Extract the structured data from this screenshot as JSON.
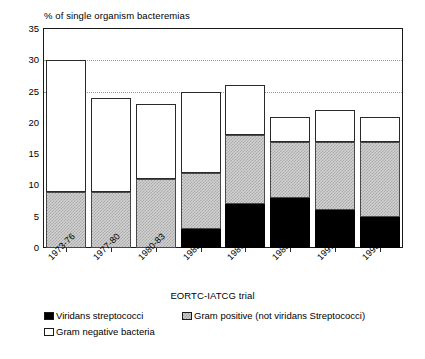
{
  "chart_data": {
    "type": "bar",
    "stacked": true,
    "title": "",
    "ylabel": "% of single organism bacteremias",
    "xlabel": "EORTC-IATCG trial",
    "ylim": [
      0,
      35
    ],
    "yticks": [
      0,
      5,
      10,
      15,
      20,
      25,
      30,
      35
    ],
    "gridlines": [
      25,
      30
    ],
    "grid": true,
    "legend_position": "below",
    "categories": [
      "1973-76",
      "1977-80",
      "1980-83",
      "1983-85",
      "1986-88",
      "1988-91",
      "1991-92",
      "1993-94"
    ],
    "series": [
      {
        "name": "Viridans streptococci",
        "color": "#000000",
        "pattern": "solid-black",
        "values": [
          0,
          0,
          0,
          3,
          7,
          8,
          6,
          5
        ]
      },
      {
        "name": "Gram positive (not viridans Streptococci)",
        "color": "#c8c8c8",
        "pattern": "dotted-gray",
        "values": [
          9,
          9,
          11,
          9,
          11,
          9,
          11,
          12
        ]
      },
      {
        "name": "Gram negative bacteria",
        "color": "#ffffff",
        "pattern": "white",
        "values": [
          21,
          15,
          12,
          13,
          8,
          4,
          5,
          4
        ]
      }
    ],
    "cumulative_tops": {
      "black": [
        0,
        0,
        0,
        3,
        7,
        8,
        6,
        5
      ],
      "gray": [
        9,
        9,
        11,
        12,
        18,
        17,
        17,
        17
      ],
      "total": [
        30,
        24,
        23,
        25,
        26,
        21,
        22,
        21
      ]
    }
  },
  "axes": {
    "y_title": "% of single organism bacteremias",
    "x_title": "EORTC-IATCG trial",
    "y_tick_labels": [
      "35",
      "30",
      "25",
      "20",
      "15",
      "10",
      "5",
      "0"
    ],
    "x_tick_labels": [
      "1973-76",
      "1977-80",
      "1980-83",
      "1983-85",
      "1986-88",
      "1988-91",
      "1991-92",
      "1993-94"
    ]
  },
  "legend": {
    "items": [
      {
        "label": "Viridans streptococci",
        "swatch": "black"
      },
      {
        "label": "Gram positive (not viridans Streptococci)",
        "swatch": "gray"
      },
      {
        "label": "Gram negative bacteria",
        "swatch": "white"
      }
    ]
  }
}
